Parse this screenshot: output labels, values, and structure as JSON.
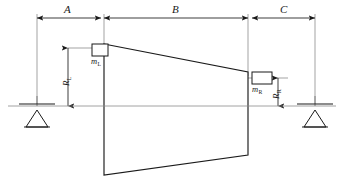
{
  "diagram": {
    "type": "engineering-schematic",
    "colors": {
      "line": "#1a1a1a",
      "thin_line": "#6b6b6b",
      "centerline": "#8a8a8a",
      "background": "#ffffff"
    },
    "dimensions_horizontal": [
      {
        "id": "A",
        "label": "A",
        "x_start": 37,
        "x_end": 101,
        "y": 18
      },
      {
        "id": "B",
        "label": "B",
        "x_start": 104,
        "x_end": 248,
        "y": 18
      },
      {
        "id": "C",
        "label": "C",
        "x_start": 252,
        "x_end": 315,
        "y": 18
      }
    ],
    "dimensions_vertical": [
      {
        "id": "RL",
        "label": "R",
        "subscript": "L",
        "x": 68,
        "y_top": 48,
        "y_bottom": 106
      },
      {
        "id": "RR",
        "label": "R",
        "subscript": "R",
        "x": 278,
        "y_top": 78,
        "y_bottom": 106
      }
    ],
    "masses": [
      {
        "id": "mL",
        "label": "m",
        "subscript": "L",
        "block_x": 92,
        "block_y": 44,
        "block_w": 16,
        "block_h": 12
      },
      {
        "id": "mR",
        "label": "m",
        "subscript": "R",
        "block_x": 252,
        "block_y": 72,
        "block_w": 20,
        "block_h": 12
      }
    ],
    "supports": [
      {
        "id": "support-left",
        "x": 37,
        "y": 106
      },
      {
        "id": "support-right",
        "x": 315,
        "y": 106
      }
    ],
    "centerline": {
      "y": 106,
      "x_start": 8,
      "x_end": 336
    },
    "rotor_body": {
      "points": "104,44 248,72 248,155 104,175",
      "left_edge_top": 44,
      "left_edge_bottom": 175,
      "right_edge_top": 72,
      "right_edge_bottom": 155
    }
  }
}
